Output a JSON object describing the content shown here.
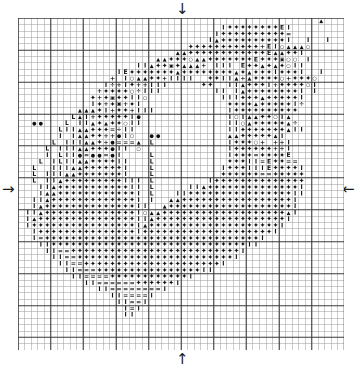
{
  "chart_data": {
    "type": "table",
    "grid": {
      "columns": 50,
      "rows": 52,
      "cell_px": 6.4,
      "bold_every": 5
    },
    "legend_symbols": [
      {
        "key": "D",
        "glyph": "✦",
        "name": "filled-diamond"
      },
      {
        "key": "T",
        "glyph": "▲",
        "name": "triangle"
      },
      {
        "key": "O",
        "glyph": "○",
        "name": "open-circle"
      },
      {
        "key": "F",
        "glyph": "●",
        "name": "filled-circle"
      },
      {
        "key": "P",
        "glyph": "+",
        "name": "plus"
      },
      {
        "key": "I",
        "glyph": "I",
        "name": "bar"
      },
      {
        "key": "E",
        "glyph": "E",
        "name": "letter-e"
      },
      {
        "key": "L",
        "glyph": "L",
        "name": "letter-l"
      },
      {
        "key": "Q",
        "glyph": "=",
        "name": "equals"
      },
      {
        "key": "V",
        "glyph": "÷",
        "name": "divide"
      },
      {
        "key": "B",
        "glyph": "▣",
        "name": "boxed-square"
      },
      {
        "key": "S",
        "glyph": "◣",
        "name": "half-stitch"
      }
    ],
    "markers": {
      "top": "↓",
      "bottom": "↑",
      "left": "→",
      "right": "←"
    },
    "cells": [
      "..............................................T...",
      "...............................IDDDDDDDDEI........",
      "..............................IDDDDDDDDDDQ........",
      ".............................ITDDDDDDDDDDI..I..I..",
      "..........................DDDDDDDDDDDPEIOTTTO+....",
      "........................TTDDDDDDDDDDDDETTDDI......",
      ".....................TTDDDOTTDDDDDDDEDDDBOO.I.....",
      "..................IITDDBDTTTP+III.EDDTDTDOII......",
      "...............IEDDDDDDDTDDDDDDDDTDTDDDIDDDI..I...",
      "..............P+IOTTDDPIIII.+DDIITPTDDDDOPDDDO.+..",
      ".............IVPIDPPIII.....DD..IITDDDIPDDDDOI....",
      "............PDDDDOVIII........II.ITDDDDDDDDI.I....",
      "...........DPDBDDIIO...........IIIDDDTDDDDDI+.....",
      "...........IDPDBPDI.............DDDDTDDDDDIV......",
      ".........TTTDIPDDPIII...........IDDDDDDDDDD.......",
      "........LTIPDDDDDIF.............IOITTDDOITA.......",
      "..FF...L.IITDTDDOII.............IIOTDDDDDTV.......",
      "......LIITTDDDQVII..............IIDDDDDDDTII......",
      "......I.ITTDDPPFIO..FF..........TTDDDDDTI+........",
      ".....L.IIITTDPFQQQT.L...........IDDDOP+PPI........",
      "....L.IIITTDDDFII.O.............IDDDDDDPPI........",
      "....I.LIIFQFFQFI....L...........IDDDQDDDDE........",
      "...L.ILIITTDDDDII...L...........DDDIIQEDDQQ.......",
      "..L..IIITTDDDDDDI...L..........IDDDIIIEDDDDI......",
      "..L.IIITTDDDDDDDI...L..........DDDDDDQQDDDDD......",
      "..L.IITDDDDDDDDDIII.L........IDDDDDDDDDDDDDD+.....",
      "...IITDDDDDDDDDDDII.L.....IITDDDDDDDDDDDDDDI......",
      "...ITTDDDDDDDDDDDDI.L...IIDDDDDDDDDDDDDDDDII......",
      "..IITDDDDDDDDDDDDDI.I..TTDDDDDDDDDDDDDDDDDI......",
      "..ITDDDDDDDDDDDDDDII..TDDDDDDDDDDDDDDDDDDDI......",
      ".IITDDDDDDDDDDDDDDIOTTDDDDDDDDDDDDDDDDDDDTI......",
      ".ITDDDDDDDDDDDDDDDIITDDDDDDDDDDDDDDDDDDDDI.......",
      ".IDDDDDDDDDDDDDDDDITDDDDDDDDDDDDDDDDDDDDI........",
      "..IDDDDDDDDDDDDDDDIDDDDDDDDDDDDDDDDDDDDI.........",
      "..IQDDDDDDDDDDDDDDDDDDDDDDDDDDDDDDDDDI..........",
      "...IIDDDDDDDDDDDDDDDDDDDDDDDDDDDDDDII...........",
      "....IIQQDDDDDDDDDDDDDDDDDDDDDDDDDDI.............",
      ".....IIQQDDDDDDDDDDDDDDDDDDDDDDDDI..............",
      "......IIQQDDDDDDDDDDDDDDDDDDDDDI................",
      ".......IIQQQDDDDDDDDDDDDDDDDII..................",
      "........IIQQQQDDDDDDDDDDDDI.....................",
      "..........IIQQQQQQDDDDDDI.......................",
      "............IIQQQQQQQQI.........................",
      "..............IIQQQQI...........................",
      "...............IIQQI............................",
      "................IQI.............................",
      "................II..............................",
      "................................................",
      "................................................",
      "................................................",
      "................................................",
      "................................................"
    ]
  }
}
